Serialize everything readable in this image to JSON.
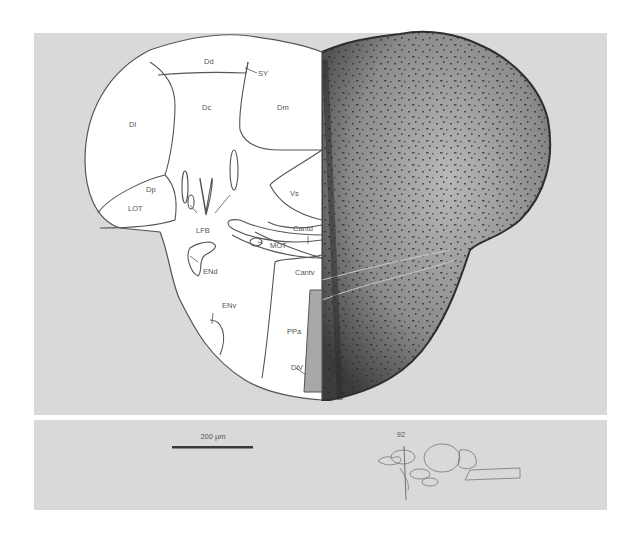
{
  "figure": {
    "section_number": "92",
    "scale_bar_label": "200 µm",
    "colors": {
      "panel_bg": "#d9d9d9",
      "outline": "#555555",
      "tissue_dark": "#3a3a3a",
      "tissue_mid": "#8a8a8a",
      "region_fill": "#ffffff"
    }
  },
  "labels": {
    "Dd": "Dd",
    "SY": "SY",
    "Dc": "Dc",
    "Dm": "Dm",
    "Dl": "Dl",
    "Dp": "Dp",
    "LOT": "LOT",
    "LFB": "LFB",
    "Vs": "Vs",
    "Cantd": "Cantd",
    "MOT": "MOT",
    "ENd": "ENd",
    "Cantv": "Cantv",
    "ENv": "ENv",
    "PPa": "PPa",
    "DiV": "DiV"
  }
}
